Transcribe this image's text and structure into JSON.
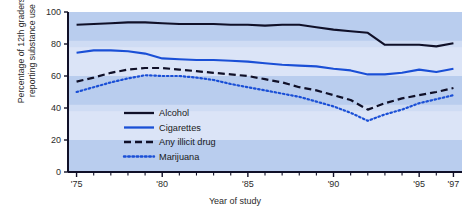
{
  "chart_data": {
    "type": "line",
    "title": "",
    "xlabel": "Year of study",
    "ylabel": "Percentage of 12th graders reporting substance use",
    "ylabel_line1": "Percentage of 12th graders",
    "ylabel_line2": "reporting substance use",
    "ylim": [
      0,
      100
    ],
    "xlim": [
      1974.5,
      1997.5
    ],
    "yticks": [
      0,
      20,
      40,
      60,
      80,
      100
    ],
    "ytick_labels": [
      "0",
      "20",
      "40",
      "60",
      "80",
      "100"
    ],
    "xtick_years": [
      1975,
      1980,
      1985,
      1990,
      1995,
      1997
    ],
    "xtick_labels": [
      "'75",
      "'80",
      "'85",
      "'90",
      "'95",
      "'97"
    ],
    "minor_tick_years": [
      1976,
      1977,
      1978,
      1979,
      1981,
      1982,
      1983,
      1984,
      1986,
      1987,
      1988,
      1989,
      1991,
      1992,
      1993,
      1994,
      1996
    ],
    "grid": false,
    "background_bands": true,
    "legend_position": "lower-left inside plot",
    "x": [
      1975,
      1976,
      1977,
      1978,
      1979,
      1980,
      1981,
      1982,
      1983,
      1984,
      1985,
      1986,
      1987,
      1988,
      1989,
      1990,
      1991,
      1992,
      1993,
      1994,
      1995,
      1996,
      1997
    ],
    "series": [
      {
        "name": "Alcohol",
        "color": "#101028",
        "style": "solid",
        "values": [
          92,
          92.5,
          93,
          93.5,
          93.5,
          93,
          92.5,
          92.5,
          92.5,
          92,
          92,
          91.5,
          92,
          92,
          90.5,
          89,
          88,
          87,
          79.5,
          79.5,
          79.5,
          78.5,
          80.5
        ]
      },
      {
        "name": "Cigarettes",
        "color": "#1a4fd6",
        "style": "solid",
        "values": [
          74.5,
          76,
          76,
          75.5,
          74,
          71,
          70.5,
          70,
          70,
          69.5,
          69,
          68,
          67,
          66.5,
          66,
          64.5,
          63.5,
          61,
          61,
          62,
          64,
          62.5,
          64.5
        ]
      },
      {
        "name": "Any illicit drug",
        "color": "#101028",
        "style": "dashed",
        "values": [
          56.5,
          59,
          62,
          64,
          65,
          65,
          64,
          63,
          62,
          61,
          60,
          58,
          56,
          53,
          51,
          48,
          45,
          39,
          43,
          46,
          48,
          50,
          52.5
        ]
      },
      {
        "name": "Marijuana",
        "color": "#1a4fd6",
        "style": "dotted",
        "values": [
          50,
          53,
          56,
          58.5,
          60.5,
          60,
          60,
          59,
          57.5,
          55,
          53,
          51,
          49,
          47,
          44,
          41,
          37,
          32,
          36,
          39,
          43,
          45.5,
          48
        ]
      }
    ]
  },
  "legend": {
    "items": [
      {
        "label": "Alcohol"
      },
      {
        "label": "Cigarettes"
      },
      {
        "label": "Any illicit drug"
      },
      {
        "label": "Marijuana"
      }
    ]
  },
  "colors": {
    "band_light": "#dbe4f7",
    "band_dark": "#b9cdee",
    "axis": "#101028",
    "alcohol": "#101028",
    "cigarettes": "#1a4fd6",
    "illicit": "#101028",
    "marijuana": "#1a4fd6",
    "page_background": "#ffffff"
  }
}
